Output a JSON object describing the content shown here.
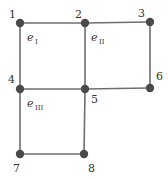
{
  "diagram": {
    "type": "finite-element-mesh",
    "colors": {
      "edge": "#6e6e6e",
      "node": "#4a4a4a",
      "text": "#333333"
    },
    "nodes": [
      {
        "id": "1",
        "x": 20,
        "y": 23,
        "lx": 9,
        "ly": 18
      },
      {
        "id": "2",
        "x": 85,
        "y": 23,
        "lx": 75,
        "ly": 18
      },
      {
        "id": "3",
        "x": 150,
        "y": 22,
        "lx": 138,
        "ly": 17
      },
      {
        "id": "4",
        "x": 20,
        "y": 89,
        "lx": 8,
        "ly": 83
      },
      {
        "id": "5",
        "x": 85,
        "y": 89,
        "lx": 91,
        "ly": 103
      },
      {
        "id": "6",
        "x": 150,
        "y": 88,
        "lx": 156,
        "ly": 80
      },
      {
        "id": "7",
        "x": 20,
        "y": 154,
        "lx": 13,
        "ly": 172
      },
      {
        "id": "8",
        "x": 84,
        "y": 154,
        "lx": 88,
        "ly": 172
      }
    ],
    "edges": [
      [
        "1",
        "2"
      ],
      [
        "2",
        "3"
      ],
      [
        "1",
        "4"
      ],
      [
        "2",
        "5"
      ],
      [
        "3",
        "6"
      ],
      [
        "4",
        "5"
      ],
      [
        "5",
        "6"
      ],
      [
        "4",
        "7"
      ],
      [
        "5",
        "8"
      ],
      [
        "7",
        "8"
      ]
    ],
    "elements": [
      {
        "symbol": "e",
        "subscript": "I",
        "x": 27,
        "y": 41
      },
      {
        "symbol": "e",
        "subscript": "II",
        "x": 91,
        "y": 41
      },
      {
        "symbol": "e",
        "subscript": "III",
        "x": 27,
        "y": 107
      }
    ]
  }
}
